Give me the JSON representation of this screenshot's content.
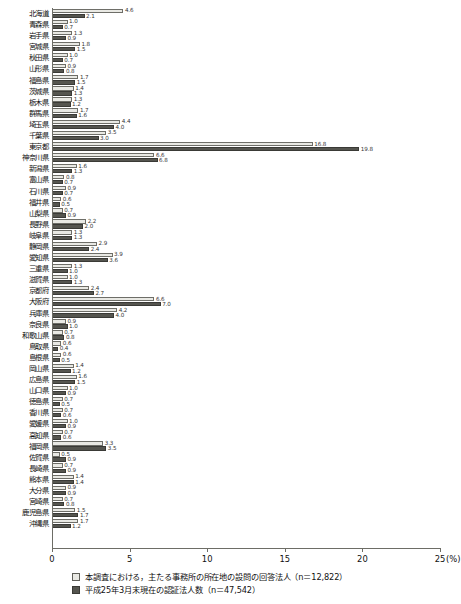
{
  "chart_data": {
    "type": "bar",
    "orientation": "horizontal",
    "title": "",
    "xlabel": "",
    "ylabel": "",
    "xlim": [
      0,
      25
    ],
    "unit": "(%)",
    "grid": false,
    "legend_position": "bottom-left",
    "tick_labels": [
      "0",
      "5",
      "10",
      "15",
      "20",
      "25"
    ],
    "categories": [
      "北海道",
      "青森県",
      "岩手県",
      "宮城県",
      "秋田県",
      "山形県",
      "福島県",
      "茨城県",
      "栃木県",
      "群馬県",
      "埼玉県",
      "千葉県",
      "東京都",
      "神奈川県",
      "新潟県",
      "富山県",
      "石川県",
      "福井県",
      "山梨県",
      "長野県",
      "岐阜県",
      "静岡県",
      "愛知県",
      "三重県",
      "滋賀県",
      "京都府",
      "大阪府",
      "兵庫県",
      "奈良県",
      "和歌山県",
      "鳥取県",
      "島根県",
      "岡山県",
      "広島県",
      "山口県",
      "徳島県",
      "香川県",
      "愛媛県",
      "高知県",
      "福岡県",
      "佐賀県",
      "長崎県",
      "熊本県",
      "大分県",
      "宮崎県",
      "鹿児島県",
      "沖縄県"
    ],
    "series": [
      {
        "name": "本調査における，主たる事務所の所在地の設問の回答法人（n＝12,822）",
        "color": "#e9e9e4",
        "values": [
          4.6,
          1.0,
          1.3,
          1.8,
          1.0,
          0.9,
          1.7,
          1.4,
          1.3,
          1.7,
          4.4,
          3.5,
          16.8,
          6.6,
          1.6,
          0.8,
          0.9,
          0.6,
          0.7,
          2.2,
          1.3,
          2.9,
          3.9,
          1.3,
          1.0,
          2.4,
          6.6,
          4.2,
          0.9,
          0.7,
          0.6,
          0.6,
          1.4,
          1.6,
          1.0,
          0.7,
          0.7,
          1.0,
          0.7,
          3.3,
          0.5,
          0.7,
          1.4,
          0.9,
          0.7,
          1.5,
          1.7
        ]
      },
      {
        "name": "平成25年3月末現在の認証法人数（n＝47,542）",
        "color": "#55554f",
        "values": [
          2.1,
          0.7,
          0.9,
          1.5,
          0.7,
          0.8,
          1.5,
          1.3,
          1.2,
          1.6,
          4.0,
          3.0,
          19.8,
          6.8,
          1.3,
          0.7,
          0.7,
          0.5,
          0.9,
          2.0,
          1.3,
          2.4,
          3.6,
          1.0,
          1.3,
          2.7,
          7.0,
          4.0,
          1.0,
          0.8,
          0.4,
          0.5,
          1.2,
          1.5,
          0.9,
          0.5,
          0.6,
          0.9,
          0.6,
          3.5,
          0.9,
          0.9,
          1.4,
          0.9,
          0.8,
          1.7,
          1.2
        ]
      }
    ]
  },
  "legend": {
    "items": [
      {
        "swatch": "light",
        "label": "本調査における，主たる事務所の所在地の設問の回答法人（n＝12,822）"
      },
      {
        "swatch": "dark",
        "label": "平成25年3月末現在の認証法人数（n＝47,542）"
      }
    ]
  }
}
